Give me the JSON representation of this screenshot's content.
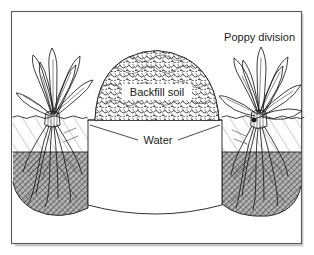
{
  "figure": {
    "kind": "cross-section-illustration",
    "border_color": "#5a5a5a",
    "ink_color": "#1a1a1a",
    "background_color": "#ffffff",
    "subsoil_color": "#8f8f8f"
  },
  "labels": {
    "poppy_division": "Poppy division",
    "backfill_soil": "Backfill soil",
    "water": "Water"
  },
  "scene": {
    "ground_line_y": 117,
    "subsoil_top_y": 152,
    "trench": {
      "left_x": 88,
      "right_x": 222,
      "top_y": 120,
      "bottom_y": 205
    },
    "mound": {
      "left_x": 95,
      "right_x": 219,
      "peak_y": 54
    },
    "plants": [
      {
        "name": "left-poppy-division",
        "crown_x": 52,
        "crown_y": 117,
        "leaf_style": "narrow-strap"
      },
      {
        "name": "right-poppy-division",
        "crown_x": 258,
        "crown_y": 117,
        "leaf_style": "broad-lance"
      }
    ]
  }
}
